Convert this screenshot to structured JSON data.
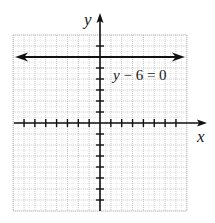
{
  "chart_data": {
    "type": "line",
    "title": "",
    "xlabel": "x",
    "ylabel": "y",
    "xlim": [
      -8,
      8
    ],
    "ylim": [
      -8,
      8
    ],
    "grid": true,
    "tick_spacing": 1,
    "series": [
      {
        "name": "y - 6 = 0",
        "equation": "y - 6 = 0",
        "kind": "horizontal-line",
        "y": 6,
        "x": [
          -8,
          8
        ],
        "values": [
          6,
          6
        ],
        "arrows": "both"
      }
    ],
    "annotations": [
      {
        "text": "y - 6 = 0",
        "x": 1,
        "y": 4
      }
    ]
  },
  "labels": {
    "x_axis": "x",
    "y_axis": "y",
    "equation_y": "y",
    "equation_rest": " − 6 = 0"
  },
  "colors": {
    "axis": "#111111",
    "grid": "#b8b8b8",
    "line": "#111111"
  }
}
